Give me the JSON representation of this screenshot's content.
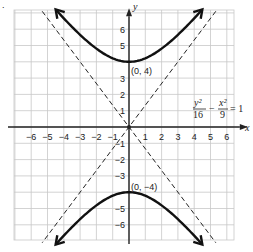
{
  "figure_marker": ".",
  "chart_data": {
    "type": "line",
    "title": "",
    "xlabel": "x",
    "ylabel": "y",
    "xlim": [
      -6.5,
      6.5
    ],
    "ylim": [
      -6.5,
      6.5
    ],
    "grid": true,
    "x_ticks": [
      -6,
      -5,
      -4,
      -3,
      -2,
      -1,
      1,
      2,
      3,
      4,
      5,
      6
    ],
    "y_ticks": [
      -6,
      -5,
      -4,
      -3,
      -2,
      -1,
      1,
      2,
      3,
      4,
      5,
      6
    ],
    "x_tick_labels": [
      "−6",
      "−5",
      "−4",
      "−3",
      "−2",
      "−1",
      "1",
      "2",
      "3",
      "4",
      "5",
      "6"
    ],
    "y_tick_labels": [
      "−6",
      "−5",
      "−4",
      "−3",
      "−2",
      "−1",
      "1",
      "2",
      "3",
      "4",
      "5",
      "6"
    ],
    "equation": {
      "num1": "y²",
      "den1": "16",
      "minus": "−",
      "num2": "x²",
      "den2": "9",
      "rhs": "= 1"
    },
    "series": [
      {
        "name": "upper branch",
        "style": "solid",
        "arrows": "both",
        "function": "y = 4*sqrt(1 + x^2/9)",
        "x_range": [
          -4.5,
          4.5
        ]
      },
      {
        "name": "lower branch",
        "style": "solid",
        "arrows": "both",
        "function": "y = -4*sqrt(1 + x^2/9)",
        "x_range": [
          -4.5,
          4.5
        ]
      },
      {
        "name": "asymptote y = 4/3 x",
        "style": "dashed",
        "function": "y = 4/3*x"
      },
      {
        "name": "asymptote y = -4/3 x",
        "style": "dashed",
        "function": "y = -4/3*x"
      }
    ],
    "annotations": [
      {
        "text": "(0, 4)",
        "x": 0,
        "y": 4
      },
      {
        "text": "(0, −4)",
        "x": 0,
        "y": -4
      }
    ]
  }
}
